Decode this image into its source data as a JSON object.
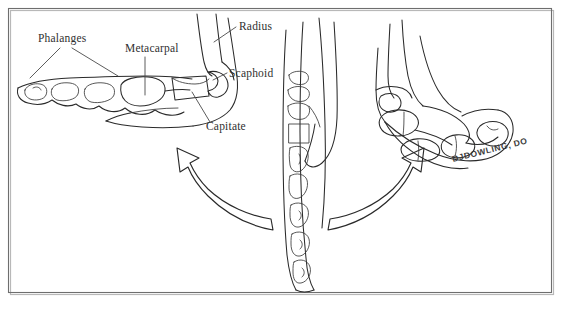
{
  "figure": {
    "background_color": "#ffffff",
    "ink_color": "#2a2a2a",
    "frame_color": "#6e6e6e",
    "width": 566,
    "height": 311
  },
  "labels": {
    "phalanges": "Phalanges",
    "metacarpal": "Metacarpal",
    "radius": "Radius",
    "scaphoid": "Scaphoid",
    "capitate": "Capitate"
  },
  "signature": {
    "text": "DJDOWLING, DO"
  },
  "arrows": {
    "left_arrow_name": "curved-arrow-left",
    "right_arrow_name": "curved-arrow-right"
  },
  "panels": {
    "left": "extended-wrist-view",
    "center": "neutral-forearm-view",
    "right": "flexed-wrist-view"
  }
}
